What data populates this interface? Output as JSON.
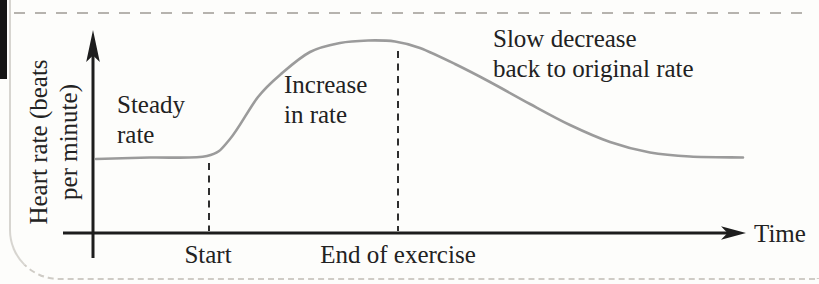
{
  "colors": {
    "paper": "#fdfdfb",
    "ink": "#222222",
    "axis": "#1d1d1d",
    "curve": "#9b9b9b",
    "dashline": "#2e2e2e",
    "cutline": "#b6b3ae",
    "edge": "#d7d5d0",
    "edge-dash": "#cfccc6"
  },
  "figure": {
    "y_axis_label": {
      "line1": "Heart rate (beats",
      "line2": "per minute)"
    },
    "x_axis_label": "Time",
    "markers": {
      "start": "Start",
      "end": "End of exercise"
    },
    "annotations": {
      "steady": {
        "line1": "Steady",
        "line2": "rate"
      },
      "increase": {
        "line1": "Increase",
        "line2": "in rate"
      },
      "slow": {
        "line1": "Slow decrease",
        "line2": "back to original rate"
      }
    }
  },
  "chart_data": {
    "type": "line",
    "title": "",
    "xlabel": "Time",
    "ylabel": "Heart rate (beats per minute)",
    "x_tick_labels": [
      "Start",
      "End of exercise"
    ],
    "x_tick_positions_frac": [
      0.18,
      0.47
    ],
    "grid": false,
    "legend": false,
    "numeric_axes": false,
    "annotations": [
      "Steady rate",
      "Increase in rate",
      "Slow decrease back to original rate"
    ],
    "segments": [
      {
        "label": "Steady rate",
        "from_frac": 0.0,
        "to_frac": 0.18,
        "trend": "flat baseline"
      },
      {
        "label": "Increase in rate",
        "from_frac": 0.18,
        "to_frac": 0.47,
        "trend": "rises to peak"
      },
      {
        "label": "Slow decrease back to original rate",
        "from_frac": 0.47,
        "to_frac": 1.0,
        "trend": "falls back to baseline"
      }
    ],
    "series": [
      {
        "name": "Heart rate",
        "x_frac": [
          0.005,
          0.088,
          0.175,
          0.211,
          0.254,
          0.289,
          0.334,
          0.38,
          0.423,
          0.465,
          0.503,
          0.557,
          0.611,
          0.672,
          0.734,
          0.795,
          0.857,
          0.918,
          1.0
        ],
        "y_frac": [
          0.383,
          0.391,
          0.399,
          0.487,
          0.705,
          0.824,
          0.938,
          0.984,
          0.997,
          0.992,
          0.959,
          0.876,
          0.782,
          0.668,
          0.56,
          0.471,
          0.417,
          0.396,
          0.391
        ]
      }
    ]
  },
  "render": {
    "curve_points_px": [
      [
        96,
        159
      ],
      [
        150,
        157.5
      ],
      [
        207,
        156
      ],
      [
        230,
        139
      ],
      [
        258,
        97
      ],
      [
        281,
        74
      ],
      [
        310,
        52
      ],
      [
        340,
        43
      ],
      [
        368,
        40.5
      ],
      [
        395,
        41.5
      ],
      [
        420,
        48
      ],
      [
        455,
        64
      ],
      [
        490,
        82
      ],
      [
        530,
        104
      ],
      [
        570,
        125
      ],
      [
        610,
        142
      ],
      [
        650,
        152.5
      ],
      [
        690,
        156.5
      ],
      [
        743,
        157.5
      ]
    ],
    "dashed_lines": [
      {
        "x": 209,
        "y_top": 163,
        "y_bottom": 231
      },
      {
        "x": 398,
        "y_top": 51,
        "y_bottom": 231
      }
    ]
  }
}
